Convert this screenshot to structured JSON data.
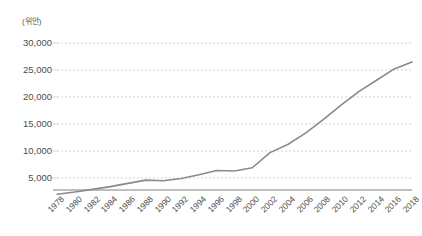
{
  "chart_data": {
    "type": "line",
    "title": "",
    "subtitle": "",
    "xlabel": "",
    "ylabel": "",
    "unit_label": "(위안)",
    "grid": true,
    "grid_axis": "y",
    "legend": false,
    "legend_position": "none",
    "line_color": "#8a8a8a",
    "axis_color": "#808080",
    "grid_color": "#c8c8c8",
    "xlim": [
      1978,
      2018
    ],
    "ylim": [
      0,
      30000
    ],
    "ytick_values": [
      30000,
      25000,
      20000,
      15000,
      10000,
      5000
    ],
    "ytick_labels": [
      "30,000",
      "25,000",
      "20,000",
      "15,000",
      "10,000",
      "5,000"
    ],
    "xtick_labels": [
      "1978",
      "1980",
      "1982",
      "1984",
      "1986",
      "1988",
      "1990",
      "1992",
      "1994",
      "1996",
      "1998",
      "2000",
      "2002",
      "2004",
      "2006",
      "2008",
      "2010",
      "2012",
      "2014",
      "2016",
      "2018"
    ],
    "x": [
      1978,
      1980,
      1982,
      1984,
      1986,
      1988,
      1990,
      1992,
      1994,
      1996,
      1998,
      2000,
      2002,
      2004,
      2006,
      2008,
      2010,
      2012,
      2014,
      2016,
      2018
    ],
    "series": [
      {
        "name": "1인당 소득",
        "values": [
          2000,
          2400,
          2900,
          3400,
          4000,
          4600,
          4500,
          4900,
          5600,
          6400,
          6300,
          6900,
          9700,
          11200,
          13300,
          15800,
          18500,
          21000,
          23100,
          25200,
          26500
        ]
      }
    ]
  }
}
